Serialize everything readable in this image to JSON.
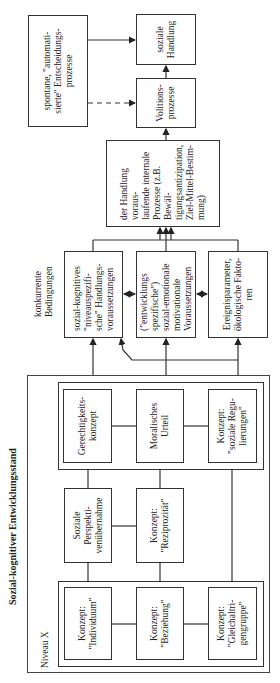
{
  "diagram": {
    "title": "Sozial-kognitiver Entwicklungsstand",
    "level_label": "Niveau X",
    "concurrent_label": "konkurrente\nBedingungen",
    "outcome": {
      "social_action": "soziale\nHandlung",
      "volition": "Volitions-\nprozesse",
      "spontaneous": "spontane, \"automati-\nsierte\" Entscheidungs-\nprozesse",
      "internal_processes": "der Handlung voraus-\nlaufende internale\nProzesse (z.B. Bewäl-\ntigungsantizipation,\nZiel-Mittel-Bestim-\nmung)"
    },
    "conditions": [
      "sozial-kognitives\n\"niveauspezifi-\nsche\" Handlungs-\nvoraussetzungen",
      "(\"entwicklungs\nspezifische\")\nsozial-emotionale\nmotivationale\nVoraussetzungen",
      "Ereignisparameter,\nökologische Fakto-\nren"
    ],
    "top_group": [
      "Gerechtigkeits-\nkonzept",
      "Moralisches\nUrteil",
      "Konzept:\n\"soziale Regu-\nlierungen\""
    ],
    "middle": [
      "Soziale Perspekti-\nvenübernahme",
      "Konzept:\n\"Reziprozität\""
    ],
    "base_group": [
      "Konzept:\n\"Individuum\"",
      "Konzept:\n\"Beziehung\"",
      "Konzept:\n\"Gleichaltri-\ngengruppe\""
    ]
  }
}
